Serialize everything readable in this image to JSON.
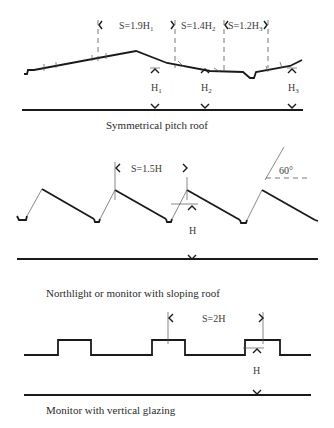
{
  "diagrams": [
    {
      "id": "symmetrical-pitch",
      "caption": "Symmetrical pitch roof",
      "spacings": [
        {
          "prefix": "S=1.9H",
          "sub": "1"
        },
        {
          "prefix": "S=1.4H",
          "sub": "2"
        },
        {
          "prefix": "S=1.2H",
          "sub": "3"
        }
      ],
      "heights": [
        {
          "prefix": "H",
          "sub": "1"
        },
        {
          "prefix": "H",
          "sub": "2"
        },
        {
          "prefix": "H",
          "sub": "3"
        }
      ]
    },
    {
      "id": "northlight",
      "caption": "Northlight or monitor with sloping roof",
      "spacing": "S=1.5H",
      "height": "H",
      "angle": "60°"
    },
    {
      "id": "monitor-vertical",
      "caption": "Monitor with vertical glazing",
      "spacing": "S=2H",
      "height": "H"
    }
  ]
}
